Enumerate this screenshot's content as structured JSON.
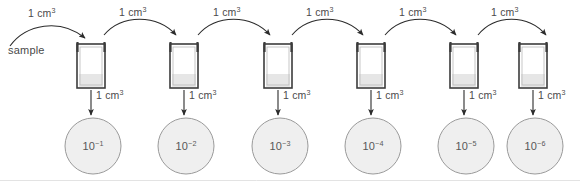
{
  "figure": {
    "sample_label": "sample",
    "volume_label": "1 cm",
    "volume_exponent": "3",
    "dish_base": "10",
    "accent_colors": {
      "tube_outline": "#3c3c3c",
      "tube_liquid": "#e6e6e6",
      "arrow": "#2b2b2b",
      "dish_fill": "#efefef",
      "dish_stroke": "#9a9a9a",
      "text": "#4a4a4a",
      "background": "#ffffff"
    }
  },
  "transfers": [
    {
      "id": "transfer-sample-to-tube-1",
      "label": "1 cm",
      "exponent": "3"
    },
    {
      "id": "transfer-tube-1-to-tube-2",
      "label": "1 cm",
      "exponent": "3"
    },
    {
      "id": "transfer-tube-2-to-tube-3",
      "label": "1 cm",
      "exponent": "3"
    },
    {
      "id": "transfer-tube-3-to-tube-4",
      "label": "1 cm",
      "exponent": "3"
    },
    {
      "id": "transfer-tube-4-to-tube-5",
      "label": "1 cm",
      "exponent": "3"
    },
    {
      "id": "transfer-tube-5-to-tube-6",
      "label": "1 cm",
      "exponent": "3"
    }
  ],
  "tubes": [
    {
      "id": "tube-1",
      "index": 1
    },
    {
      "id": "tube-2",
      "index": 2
    },
    {
      "id": "tube-3",
      "index": 3
    },
    {
      "id": "tube-4",
      "index": 4
    },
    {
      "id": "tube-5",
      "index": 5
    },
    {
      "id": "tube-6",
      "index": 6
    }
  ],
  "platings": [
    {
      "id": "plating-1",
      "label": "1 cm",
      "exponent": "3"
    },
    {
      "id": "plating-2",
      "label": "1 cm",
      "exponent": "3"
    },
    {
      "id": "plating-3",
      "label": "1 cm",
      "exponent": "3"
    },
    {
      "id": "plating-4",
      "label": "1 cm",
      "exponent": "3"
    },
    {
      "id": "plating-5",
      "label": "1 cm",
      "exponent": "3"
    },
    {
      "id": "plating-6",
      "label": "1 cm",
      "exponent": "3"
    }
  ],
  "dishes": [
    {
      "id": "dish-1",
      "base": "10",
      "exponent": "−1",
      "dilution": "10^-1"
    },
    {
      "id": "dish-2",
      "base": "10",
      "exponent": "−2",
      "dilution": "10^-2"
    },
    {
      "id": "dish-3",
      "base": "10",
      "exponent": "−3",
      "dilution": "10^-3"
    },
    {
      "id": "dish-4",
      "base": "10",
      "exponent": "−4",
      "dilution": "10^-4"
    },
    {
      "id": "dish-5",
      "base": "10",
      "exponent": "−5",
      "dilution": "10^-5"
    },
    {
      "id": "dish-6",
      "base": "10",
      "exponent": "−6",
      "dilution": "10^-6"
    }
  ]
}
